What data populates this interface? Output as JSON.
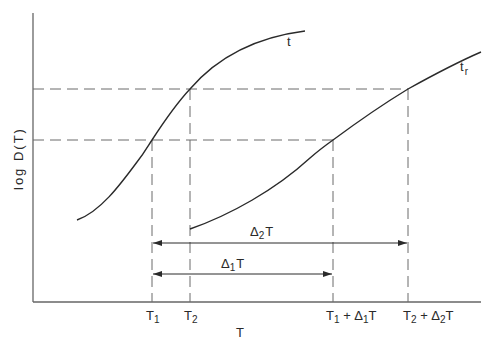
{
  "diagram": {
    "y_axis_label": "log D(T)",
    "x_axis_label": "T",
    "curves": [
      {
        "name": "t",
        "label": "t"
      },
      {
        "name": "t_r",
        "label": "t",
        "subscript": "r"
      }
    ],
    "x_ticks": [
      {
        "id": "T1",
        "main": "T",
        "sub": "1"
      },
      {
        "id": "T2",
        "main": "T",
        "sub": "2"
      },
      {
        "id": "T1_plus_D1T",
        "parts": [
          "T",
          "1",
          " + Δ",
          "1",
          "T"
        ]
      },
      {
        "id": "T2_plus_D2T",
        "parts": [
          "T",
          "2",
          " + Δ",
          "2",
          "T"
        ]
      }
    ],
    "intervals": [
      {
        "id": "delta2T",
        "main": "Δ",
        "sub": "2",
        "tail": "T",
        "from": "T1",
        "to": "T2 + Δ2T"
      },
      {
        "id": "delta1T",
        "main": "Δ",
        "sub": "1",
        "tail": "T",
        "from": "T1",
        "to": "T1 + Δ1T"
      }
    ],
    "colors": {
      "line": "#2a2a2a",
      "dash": "#6a6a6a",
      "axis": "#666666"
    }
  }
}
